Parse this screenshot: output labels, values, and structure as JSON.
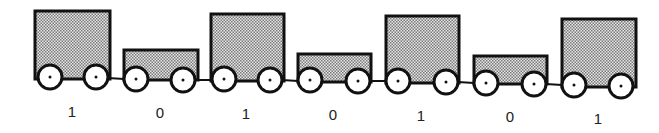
{
  "diagram": {
    "colors": {
      "stroke": "#111111",
      "fill_pattern": "#bfbfbf",
      "wheel": "#ffffff"
    },
    "carts": [
      {
        "label": "1",
        "type": "tall"
      },
      {
        "label": "0",
        "type": "short"
      },
      {
        "label": "1",
        "type": "tall"
      },
      {
        "label": "0",
        "type": "short"
      },
      {
        "label": "1",
        "type": "tall"
      },
      {
        "label": "0",
        "type": "short"
      },
      {
        "label": "1",
        "type": "tall"
      }
    ]
  }
}
